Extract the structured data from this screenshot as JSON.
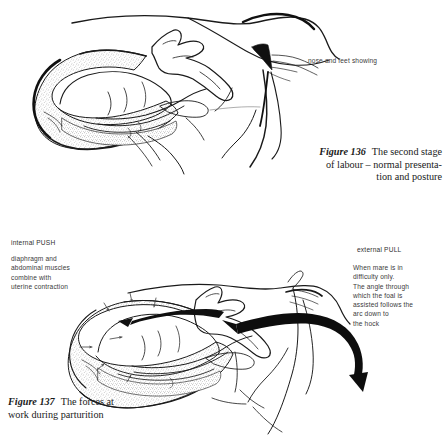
{
  "page": {
    "background_color": "#ffffff",
    "ink_color": "#1a1a1a",
    "annotation_color": "#3a3a3a",
    "stipple_color": "#8d8d8d"
  },
  "figures": [
    {
      "id": "figure-136",
      "figure_label": "Figure 136",
      "caption_line_1": "The second stage",
      "caption_line_2": "of labour – normal presenta-",
      "caption_line_3": "tion and posture",
      "annotations": [
        {
          "id": "nose-and-feet",
          "text": "nose and feet showing"
        }
      ]
    },
    {
      "id": "figure-137",
      "figure_label": "Figure 137",
      "caption_line_1": "The forces at",
      "caption_line_2": "work during parturition",
      "annotations": [
        {
          "id": "internal-push",
          "heading": "internal PUSH",
          "body": "diaphragm and\nabdominal muscles\ncombine with\nuterine contraction"
        },
        {
          "id": "external-pull",
          "heading": "external PULL",
          "body": "When mare is in\ndifficulty only.\nThe angle through\nwhich the foal is\nassisted follows the\narc down to\nthe hock"
        }
      ]
    }
  ]
}
